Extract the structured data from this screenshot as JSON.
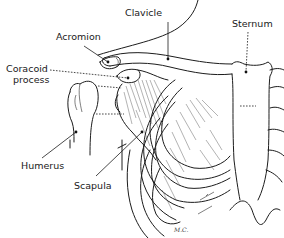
{
  "figure": {
    "labels": {
      "clavicle": "Clavicle",
      "acromion": "Acromion",
      "coracoid_line1": "Coracoid",
      "coracoid_line2": "process",
      "sternum": "Sternum",
      "humerus": "Humerus",
      "scapula": "Scapula"
    },
    "artist_initials": "M.C."
  }
}
